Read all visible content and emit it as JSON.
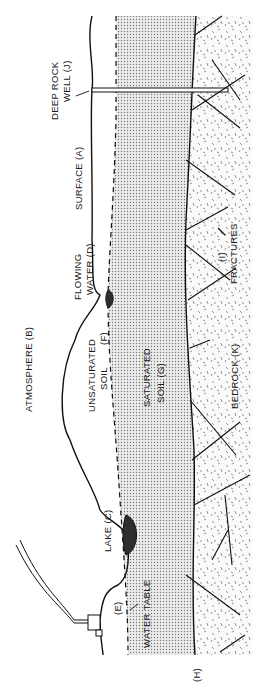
{
  "diagram": {
    "orientation": "rotated 90 degrees counter-clockwise",
    "colors": {
      "background": "#ffffff",
      "ink": "#111111",
      "saturated_fill": "#d9d9d9",
      "bedrock_fill": "#f2f2f2",
      "lake_fill": "#2b2b2b"
    },
    "labels": {
      "surface": "SURFACE (A)",
      "atmosphere": "ATMOSPHERE (B)",
      "lake": "LAKE (C)",
      "flowing_water_1": "FLOWING",
      "flowing_water_2": "WATER (D)",
      "water_table_marker": "(E)",
      "water_table": "WATER TABLE",
      "unsaturated_1": "UNSATURATED",
      "unsaturated_2": "SOIL",
      "unsaturated_marker": "(F)",
      "saturated_1": "SATURATED",
      "saturated_2": "SOIL (G)",
      "bedrock_boundary": "(H)",
      "fractures_marker": "(I)",
      "fractures": "FRACTURES",
      "well_1": "DEEP ROCK",
      "well_2": "WELL (J)",
      "bedrock": "BEDROCK (K)"
    }
  }
}
